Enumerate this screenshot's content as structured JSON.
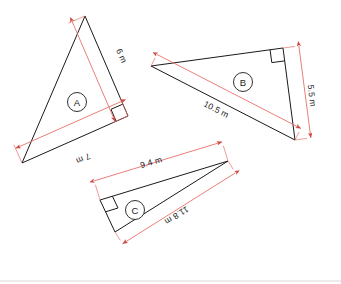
{
  "figure": {
    "unit": "m",
    "stroke_color": "#1a1a1a",
    "dimension_color": "#e8706a",
    "background_color": "#ffffff",
    "footer_rule_color": "#d8d8d8"
  },
  "shapes": [
    {
      "id": "A",
      "badge": "A",
      "badge_center": {
        "x": 77,
        "y": 102
      },
      "vertices": [
        {
          "x": 85,
          "y": 16
        },
        {
          "x": 128,
          "y": 116
        },
        {
          "x": 22,
          "y": 163
        }
      ],
      "right_angle_at": {
        "x": 128,
        "y": 116
      },
      "dimensions": [
        {
          "name": "A-hypotenuse",
          "label": "6 m",
          "from": {
            "x": 85,
            "y": 16
          },
          "to": {
            "x": 128,
            "y": 116
          },
          "offset": 14,
          "text_x": 119,
          "text_y": 57,
          "text_rotation": 66
        },
        {
          "name": "A-base",
          "label": "7 m",
          "from": {
            "x": 128,
            "y": 116
          },
          "to": {
            "x": 22,
            "y": 163
          },
          "offset": 16,
          "text_x": 82,
          "text_y": 156,
          "text_rotation": 156
        }
      ]
    },
    {
      "id": "B",
      "badge": "B",
      "badge_center": {
        "x": 243,
        "y": 82
      },
      "vertices": [
        {
          "x": 151,
          "y": 66
        },
        {
          "x": 283,
          "y": 48
        },
        {
          "x": 295,
          "y": 140
        }
      ],
      "right_angle_at": {
        "x": 283,
        "y": 48
      },
      "dimensions": [
        {
          "name": "B-hypotenuse",
          "label": "10.5 m",
          "from": {
            "x": 151,
            "y": 66
          },
          "to": {
            "x": 295,
            "y": 140
          },
          "offset": -13,
          "text_x": 215,
          "text_y": 112,
          "text_rotation": 27
        },
        {
          "name": "B-side",
          "label": "5.5 m",
          "from": {
            "x": 283,
            "y": 48
          },
          "to": {
            "x": 295,
            "y": 140
          },
          "offset": -16,
          "text_x": 309,
          "text_y": 96,
          "text_rotation": 83
        }
      ]
    },
    {
      "id": "C",
      "badge": "C",
      "badge_center": {
        "x": 135,
        "y": 210
      },
      "vertices": [
        {
          "x": 100,
          "y": 200
        },
        {
          "x": 228,
          "y": 161
        },
        {
          "x": 115,
          "y": 232
        }
      ],
      "right_angle_at": {
        "x": 100,
        "y": 200
      },
      "dimensions": [
        {
          "name": "C-top",
          "label": "9.4 m",
          "from": {
            "x": 100,
            "y": 200
          },
          "to": {
            "x": 228,
            "y": 161
          },
          "offset": -20,
          "text_x": 152,
          "text_y": 165,
          "text_rotation": -17
        },
        {
          "name": "C-hypotenuse",
          "label": "11.8 m",
          "from": {
            "x": 228,
            "y": 161
          },
          "to": {
            "x": 115,
            "y": 232
          },
          "offset": -14,
          "text_x": 175,
          "text_y": 213,
          "text_rotation": 148
        }
      ]
    }
  ],
  "footer": {
    "rule_y": 281
  }
}
